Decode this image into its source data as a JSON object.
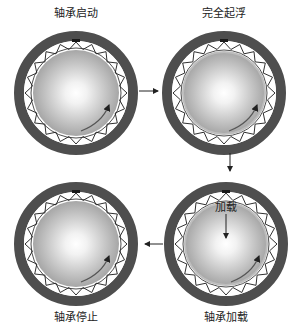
{
  "stages": [
    {
      "id": "start",
      "label": "轴承启动",
      "cx": 76,
      "cy": 93
    },
    {
      "id": "float",
      "label": "完全起浮",
      "cx": 224,
      "cy": 93
    },
    {
      "id": "load",
      "label": "轴承加载",
      "cx": 226,
      "cy": 244,
      "inner_label": "加载"
    },
    {
      "id": "stop",
      "label": "轴承停止",
      "cx": 76,
      "cy": 244
    }
  ],
  "colors": {
    "housing": "#4a4a4a",
    "foil": "#1a1a1a",
    "shaft_edge": "#9a9a9a",
    "shaft_center": "#ffffff",
    "arrow": "#222222"
  }
}
